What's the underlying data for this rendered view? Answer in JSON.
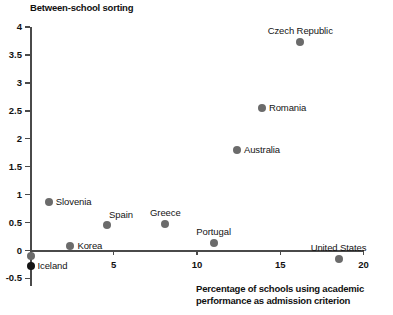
{
  "chart_data": {
    "type": "scatter",
    "title": "",
    "ylabel": "Between-school sorting",
    "xlabel": "Percentage of schools using academic performance as admission criterion",
    "xlabel_line1": "Percentage of schools using academic",
    "xlabel_line2": "performance as admission criterion",
    "xlim": [
      0,
      20
    ],
    "ylim": [
      -0.5,
      4
    ],
    "grid": false,
    "legend": "none",
    "x_ticks": [
      5,
      10,
      15,
      20
    ],
    "x_tick_labels": [
      "5",
      "10",
      "15",
      "20"
    ],
    "y_ticks": [
      -0.5,
      0,
      0.5,
      1,
      1.5,
      2,
      2.5,
      3,
      3.5,
      4
    ],
    "y_tick_labels": [
      "-0.5",
      "0",
      "0.5",
      "1",
      "1.5",
      "2",
      "2.5",
      "3",
      "3.5",
      "4"
    ],
    "marker_color": "#6b6b6b",
    "marker_color_dark": "#141414",
    "axis_color": "#4a4a4a",
    "points": [
      {
        "label": "Czech Republic",
        "x": 16.2,
        "y": 3.73,
        "label_pos": "above"
      },
      {
        "label": "Romania",
        "x": 13.9,
        "y": 2.55,
        "label_pos": "right"
      },
      {
        "label": "Australia",
        "x": 12.4,
        "y": 1.8,
        "label_pos": "right"
      },
      {
        "label": "Slovenia",
        "x": 1.1,
        "y": 0.86,
        "label_pos": "right"
      },
      {
        "label": "Spain",
        "x": 4.6,
        "y": 0.45,
        "label_pos": "above-right"
      },
      {
        "label": "Greece",
        "x": 8.1,
        "y": 0.47,
        "label_pos": "above"
      },
      {
        "label": "Portugal",
        "x": 11.0,
        "y": 0.14,
        "label_pos": "above"
      },
      {
        "label": "Korea",
        "x": 2.4,
        "y": 0.08,
        "label_pos": "right"
      },
      {
        "label": "Iceland",
        "x": 0.0,
        "y": -0.1,
        "label_pos": "none"
      },
      {
        "label": "Iceland",
        "x": 0.0,
        "y": -0.27,
        "label_pos": "right",
        "dark": true
      },
      {
        "label": "United States",
        "x": 18.5,
        "y": -0.16,
        "label_pos": "above"
      }
    ]
  }
}
